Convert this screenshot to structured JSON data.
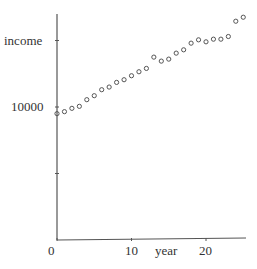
{
  "chart_data": {
    "type": "scatter",
    "title": "",
    "xlabel": "year",
    "ylabel": "income",
    "x": [
      0,
      1,
      2,
      3,
      4,
      5,
      6,
      7,
      8,
      9,
      10,
      11,
      12,
      13,
      14,
      15,
      16,
      17,
      18,
      19,
      20,
      21,
      22,
      23,
      24,
      25
    ],
    "values": [
      9500,
      9650,
      9900,
      10050,
      10550,
      10850,
      11300,
      11500,
      11850,
      12050,
      12350,
      12650,
      12900,
      13750,
      13450,
      13600,
      14050,
      14300,
      14800,
      15050,
      14900,
      15100,
      15100,
      15300,
      16450,
      16750
    ],
    "xticks": [
      0,
      10,
      20
    ],
    "ytick_labels": [
      {
        "value": 10000,
        "label": "10000"
      }
    ],
    "yticks": [
      5000,
      10000,
      15000
    ],
    "xlim": [
      0,
      25.5
    ],
    "ylim": [
      0,
      17800
    ],
    "grid": false,
    "legend": "none",
    "marker": "open-circle",
    "color": "#555555"
  },
  "axes": {
    "x_origin_label": "0",
    "x_tick_10": "10",
    "x_tick_20": "20",
    "x_label": "year",
    "y_label": "income",
    "y_tick_10000": "10000"
  }
}
